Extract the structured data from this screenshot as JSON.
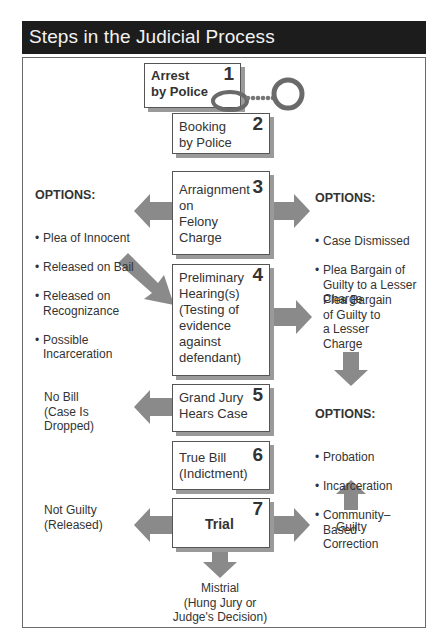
{
  "title": "Steps in the Judicial Process",
  "colors": {
    "titlebar_bg": "#1c1c1c",
    "arrow": "#8a8a8a",
    "box_shadow": "#9a9a9a"
  },
  "steps": [
    {
      "number": "1",
      "label": "Arrest\nby Police",
      "icon": "handcuffs-icon"
    },
    {
      "number": "2",
      "label": "Booking\nby Police"
    },
    {
      "number": "3",
      "label": "Arraignment\non\nFelony\nCharge"
    },
    {
      "number": "4",
      "label": "Preliminary\nHearing(s)\n(Testing of\nevidence\nagainst\ndefendant)"
    },
    {
      "number": "5",
      "label": "Grand Jury\nHears Case"
    },
    {
      "number": "6",
      "label": "True Bill\n(Indictment)"
    },
    {
      "number": "7",
      "label": "Trial"
    }
  ],
  "arraignment_left_options": {
    "heading": "OPTIONS:",
    "items": [
      "Plea of Innocent",
      "Released on Bail",
      "Released on\nRecognizance",
      "Possible\nIncarceration"
    ]
  },
  "arraignment_right_options": {
    "heading": "OPTIONS:",
    "items": [
      "Case Dismissed",
      "Plea Bargain of\nGuilty to a Lesser\nCharge"
    ]
  },
  "hearing_right": "Plea Bargain\nof Guilty to\na Lesser\nCharge",
  "sentencing_options": {
    "heading": "OPTIONS:",
    "items": [
      "Probation",
      "Incarceration",
      "Community–\nBased\nCorrection"
    ]
  },
  "grand_jury_left": "No Bill\n(Case Is\nDropped)",
  "trial_left": "Not Guilty\n(Released)",
  "trial_right": "Guilty",
  "trial_down": "Mistrial\n(Hung Jury or\nJudge's Decision)"
}
